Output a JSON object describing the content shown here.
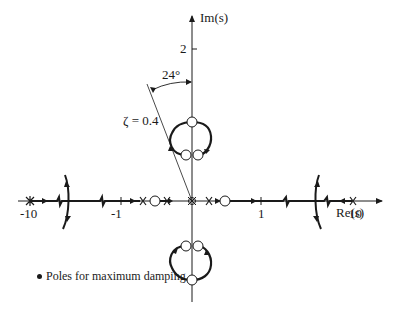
{
  "figure": {
    "type": "root-locus",
    "axes": {
      "x_label": "Re(s)",
      "y_label": "Im(s)",
      "x_ticks": [
        "-10",
        "-1",
        "1",
        "10"
      ],
      "y_ticks": [
        "2"
      ]
    },
    "annotations": {
      "angle": "24°",
      "damping": "ζ = 0.4"
    },
    "legend": {
      "marker": "filled-dot",
      "label": "Poles for maximum damping"
    },
    "colors": {
      "ink": "#1a1a1a",
      "background": "#ffffff"
    }
  }
}
